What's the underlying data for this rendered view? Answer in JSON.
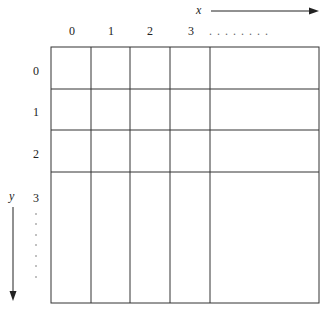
{
  "diagram": {
    "type": "grid-coordinate-system",
    "x_axis": {
      "label": "x",
      "direction": "right"
    },
    "y_axis": {
      "label": "y",
      "direction": "down"
    },
    "column_labels": [
      "0",
      "1",
      "2",
      "3"
    ],
    "column_ellipsis": ". . . . . . . .",
    "row_labels": [
      "0",
      "1",
      "2",
      "3"
    ],
    "row_ellipsis_dots": 8,
    "line_color": "#333333"
  }
}
